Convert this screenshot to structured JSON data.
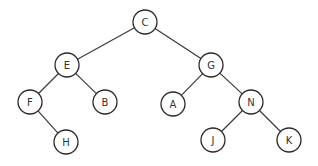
{
  "diagram": {
    "type": "binary-tree",
    "nodes": [
      {
        "id": "C",
        "label": "C",
        "x": 145,
        "y": 22
      },
      {
        "id": "E",
        "label": "E",
        "x": 67,
        "y": 65
      },
      {
        "id": "G",
        "label": "G",
        "x": 211,
        "y": 65
      },
      {
        "id": "F",
        "label": "F",
        "x": 30,
        "y": 102
      },
      {
        "id": "B",
        "label": "B",
        "x": 105,
        "y": 102
      },
      {
        "id": "A",
        "label": "A",
        "x": 173,
        "y": 104
      },
      {
        "id": "N",
        "label": "N",
        "x": 251,
        "y": 102
      },
      {
        "id": "H",
        "label": "H",
        "x": 66,
        "y": 142
      },
      {
        "id": "J",
        "label": "J",
        "x": 213,
        "y": 140
      },
      {
        "id": "K",
        "label": "K",
        "x": 289,
        "y": 140
      }
    ],
    "edges": [
      {
        "from": "C",
        "to": "E"
      },
      {
        "from": "C",
        "to": "G"
      },
      {
        "from": "E",
        "to": "F"
      },
      {
        "from": "E",
        "to": "B"
      },
      {
        "from": "F",
        "to": "H"
      },
      {
        "from": "G",
        "to": "A"
      },
      {
        "from": "G",
        "to": "N"
      },
      {
        "from": "N",
        "to": "J"
      },
      {
        "from": "N",
        "to": "K"
      }
    ],
    "node_radius": 12
  }
}
